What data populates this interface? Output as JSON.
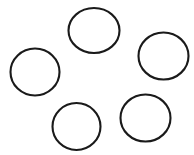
{
  "figure": {
    "background_color": "#ffffff",
    "width": 194,
    "height": 155,
    "shape_count_label": "5",
    "stroke_color": "#1a1a1a",
    "stroke_width": 2.1
  },
  "chart_data": {
    "type": "scatter",
    "subtitle": "",
    "xlabel": "",
    "ylabel": "",
    "xlim": [
      0,
      194
    ],
    "ylim": [
      0,
      155
    ],
    "grid": false,
    "legend": "none",
    "annotations": [],
    "tick_labels": {
      "x": [],
      "y": []
    },
    "marker": {
      "shape": "circle",
      "fill": "none",
      "edge_color": "#1a1a1a",
      "edge_width": 2.1
    },
    "categories": [
      "top-circle",
      "left-circle",
      "right-circle",
      "bottom-center-circle",
      "bottom-right-circle"
    ],
    "shapes": [
      {
        "name": "top-circle",
        "position": "top-center",
        "cx": 94,
        "cy": 30.5,
        "rx": 25.5,
        "ry": 22.5,
        "stroke": "#1a1a1a",
        "stroke_width": 2.1,
        "fill": "none"
      },
      {
        "name": "left-circle",
        "position": "middle-left",
        "cx": 35,
        "cy": 72,
        "rx": 24.5,
        "ry": 23.5,
        "stroke": "#1a1a1a",
        "stroke_width": 2.1,
        "fill": "none"
      },
      {
        "name": "right-circle",
        "position": "middle-right",
        "cx": 163.5,
        "cy": 56,
        "rx": 25,
        "ry": 23.5,
        "stroke": "#1a1a1a",
        "stroke_width": 2.1,
        "fill": "none"
      },
      {
        "name": "bottom-center-circle",
        "position": "bottom-center",
        "cx": 76.5,
        "cy": 126.5,
        "rx": 24,
        "ry": 23.5,
        "stroke": "#1a1a1a",
        "stroke_width": 2.1,
        "fill": "none"
      },
      {
        "name": "bottom-right-circle",
        "position": "bottom-right",
        "cx": 145.5,
        "cy": 118,
        "rx": 25,
        "ry": 23.5,
        "stroke": "#1a1a1a",
        "stroke_width": 2.1,
        "fill": "none"
      }
    ],
    "x": [
      94,
      35,
      163.5,
      76.5,
      145.5
    ],
    "y": [
      30.5,
      72,
      56,
      126.5,
      118
    ],
    "sizes": [
      25.5,
      24.5,
      25,
      24,
      25
    ]
  }
}
